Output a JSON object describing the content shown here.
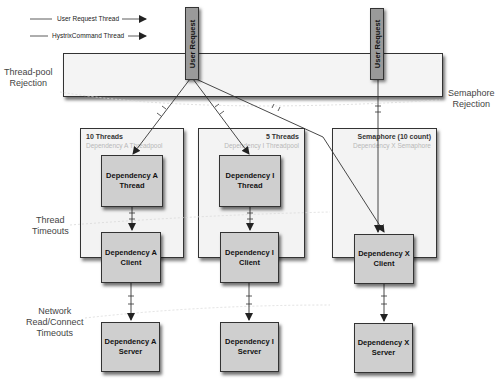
{
  "legend": {
    "items": [
      {
        "label": "User Request Thread",
        "style": "solid-arrow"
      },
      {
        "label": "HystrixCommand Thread",
        "style": "solid-arrow"
      }
    ]
  },
  "user_requests": [
    {
      "label": "User Request"
    },
    {
      "label": "User Request"
    }
  ],
  "zones": {
    "thread_pool_rejection": "Thread-pool\nRejection",
    "semaphore_rejection": "Semaphore\nRejection",
    "thread_timeouts": "Thread\nTimeouts",
    "network_timeouts": "Network\nRead/Connect\nTimeouts"
  },
  "containers": [
    {
      "title": "10 Threads",
      "subtitle": "Dependency A Threadpool",
      "align": "left"
    },
    {
      "title": "5 Threads",
      "subtitle": "Dependency I Threadpool",
      "align": "right"
    },
    {
      "title": "Semaphore (10 count)",
      "subtitle": "Dependency X Semaphore",
      "align": "right"
    }
  ],
  "nodes": {
    "a_thread": "Dependency A\nThread",
    "i_thread": "Dependency I\nThread",
    "a_client": "Dependency A\nClient",
    "i_client": "Dependency I\nClient",
    "x_client": "Dependency X\nClient",
    "a_server": "Dependency A\nServer",
    "i_server": "Dependency I\nServer",
    "x_server": "Dependency X\nServer"
  },
  "colors": {
    "node_fill": "#cfcfcf",
    "container_fill": "#f3f3f3",
    "user_request_fill": "#9a9a9a",
    "stroke": "#333333",
    "subtitle_text": "#b8b8b8"
  }
}
